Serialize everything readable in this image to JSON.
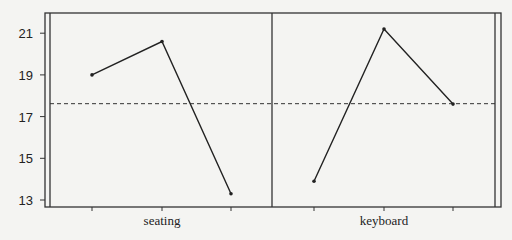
{
  "chart_data": {
    "type": "line",
    "title": "",
    "xlabel": "",
    "ylabel": "",
    "ylim": [
      12.6,
      22.0
    ],
    "yticks": [
      13,
      15,
      17,
      19,
      21
    ],
    "grid": false,
    "reference_line": {
      "value": 17.62,
      "style": "dashed"
    },
    "panels": [
      {
        "label": "seating",
        "x": [
          1,
          2,
          3
        ],
        "values": [
          19.0,
          20.6,
          13.3
        ]
      },
      {
        "label": "keyboard",
        "x": [
          1,
          2,
          3
        ],
        "values": [
          13.9,
          21.2,
          17.6
        ]
      }
    ]
  },
  "axis": {
    "y_tick_labels": [
      "13",
      "15",
      "17",
      "19",
      "21"
    ]
  },
  "panels": [
    {
      "label": "seating"
    },
    {
      "label": "keyboard"
    }
  ]
}
